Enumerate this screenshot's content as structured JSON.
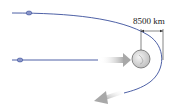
{
  "diagram": {
    "type": "orbital-trajectory",
    "distance_label": "8500 km",
    "colors": {
      "trajectory": "#3a4f9c",
      "spacecraft": "#8a96c8",
      "planet_fill": "#d6d6d6",
      "planet_stroke": "#6a6a6a",
      "arrow": "#b0b0b0",
      "dimension_line": "#333333"
    },
    "elements": [
      {
        "name": "hyperbolic-trajectory",
        "description": "curved path passing around planet"
      },
      {
        "name": "approach-trajectory",
        "description": "straight incoming path"
      },
      {
        "name": "spacecraft-upper",
        "description": "spacecraft on upper path"
      },
      {
        "name": "spacecraft-lower",
        "description": "spacecraft on lower path"
      },
      {
        "name": "planet",
        "description": "planet at focus"
      },
      {
        "name": "incoming-arrow",
        "description": "gray arrow pointing toward planet"
      },
      {
        "name": "outgoing-arrow",
        "description": "gray arrow pointing down-left"
      },
      {
        "name": "distance-dimension",
        "description": "dimension marker showing closest approach distance"
      }
    ]
  }
}
